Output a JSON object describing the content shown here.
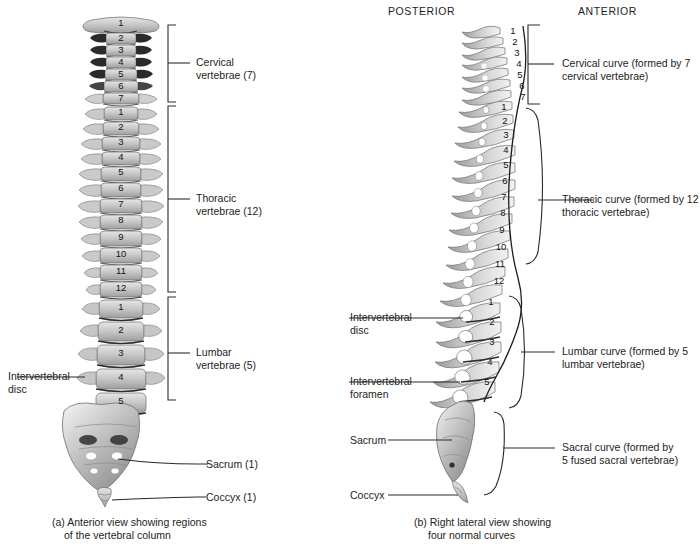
{
  "figure": {
    "background": "#ffffff",
    "ink": "#1d1d1d"
  },
  "orientation_labels": {
    "posterior": "POSTERIOR",
    "anterior": "ANTERIOR"
  },
  "panel_a": {
    "caption_line1": "(a) Anterior view showing regions",
    "caption_line2": "of the vertebral column",
    "region_brackets": [
      {
        "name": "cervical",
        "label_line1": "Cervical",
        "label_line2": "vertebrae (7)"
      },
      {
        "name": "thoracic",
        "label_line1": "Thoracic",
        "label_line2": "vertebrae (12)"
      },
      {
        "name": "lumbar",
        "label_line1": "Lumbar",
        "label_line2": "vertebrae (5)"
      }
    ],
    "callouts": [
      {
        "name": "intervertebral-disc",
        "label_line1": "Intervertebral",
        "label_line2": "disc"
      },
      {
        "name": "sacrum",
        "label_line1": "Sacrum (1)",
        "label_line2": ""
      },
      {
        "name": "coccyx",
        "label_line1": "Coccyx (1)",
        "label_line2": ""
      }
    ],
    "cervical_numbers": [
      "1",
      "2",
      "3",
      "4",
      "5",
      "6",
      "7"
    ],
    "thoracic_numbers": [
      "1",
      "2",
      "3",
      "4",
      "5",
      "6",
      "7",
      "8",
      "9",
      "10",
      "11",
      "12"
    ],
    "lumbar_numbers": [
      "1",
      "2",
      "3",
      "4",
      "5"
    ]
  },
  "panel_b": {
    "caption_line1": "(b) Right lateral view showing",
    "caption_line2": "four normal curves",
    "curve_callouts": [
      {
        "name": "cervical-curve",
        "label_line1": "Cervical curve (formed by 7",
        "label_line2": "cervical vertebrae)"
      },
      {
        "name": "thoracic-curve",
        "label_line1": "Thoracic curve (formed by 12",
        "label_line2": "thoracic vertebrae)"
      },
      {
        "name": "lumbar-curve",
        "label_line1": "Lumbar curve (formed by 5",
        "label_line2": "lumbar vertebrae)"
      },
      {
        "name": "sacral-curve",
        "label_line1": "Sacral curve (formed by",
        "label_line2": "5 fused sacral vertebrae)"
      }
    ],
    "left_callouts": [
      {
        "name": "intervertebral-disc",
        "label_line1": "Intervertebral",
        "label_line2": "disc"
      },
      {
        "name": "intervertebral-foramen",
        "label_line1": "Intervertebral",
        "label_line2": "foramen"
      },
      {
        "name": "sacrum",
        "label_line1": "Sacrum",
        "label_line2": ""
      },
      {
        "name": "coccyx",
        "label_line1": "Coccyx",
        "label_line2": ""
      }
    ],
    "cervical_numbers": [
      "1",
      "2",
      "3",
      "4",
      "5",
      "6",
      "7"
    ],
    "thoracic_numbers": [
      "1",
      "2",
      "3",
      "4",
      "5",
      "6",
      "7",
      "8",
      "9",
      "10",
      "11",
      "12"
    ],
    "lumbar_numbers": [
      "1",
      "2",
      "3",
      "4",
      "5"
    ]
  }
}
